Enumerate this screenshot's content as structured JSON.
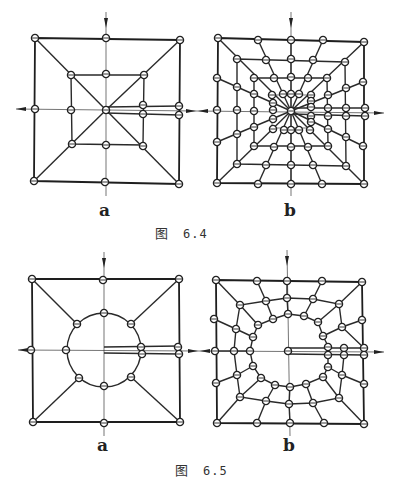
{
  "figures": [
    {
      "id": "fig-6-4",
      "caption_prefix": "图",
      "caption_number": "6.4",
      "panels": [
        {
          "label": "a",
          "description": "Square mesh with a central node, diagonals, inner square, and a crack running from the center to the right edge (duplicated nodes)"
        },
        {
          "label": "b",
          "description": "Refined square mesh with radial lines converging at the crack tip and several concentric rings, crack running from center to right edge"
        }
      ]
    },
    {
      "id": "fig-6-5",
      "caption_prefix": "图",
      "caption_number": "6.5",
      "panels": [
        {
          "label": "a",
          "description": "Square mesh with a central circular hole, eight ring nodes connected to the outer frame, crack from hole to right edge"
        },
        {
          "label": "b",
          "description": "Refined mesh around a circular hole with two concentric rings of nodes connected radially to the outer square, crack from hole to right edge"
        }
      ]
    }
  ],
  "labels": {
    "fig4a": "a",
    "fig4b": "b",
    "fig5a": "a",
    "fig5b": "b",
    "cap4_prefix": "图",
    "cap4_num": "6.4",
    "cap5_prefix": "图",
    "cap5_num": "6.5"
  }
}
